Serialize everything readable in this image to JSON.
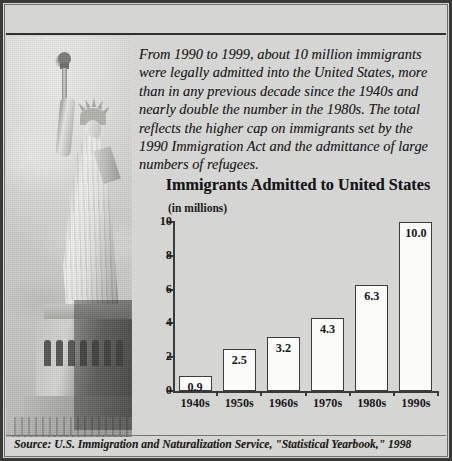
{
  "headline": "Flow of Immigrants Steadily Increased",
  "intro": "From 1990 to 1999, about 10 million immigrants were legally admitted into the United States, more than in any previous decade since the 1940s and nearly double the number in the 1980s. The total reflects the higher cap on immigrants set by the 1990 Immigration Act and the admittance of large numbers of refugees.",
  "photo": {
    "caption": "statue-of-liberty-photograph"
  },
  "source": "Source: U.S. Immigration and Naturalization Service, \"Statistical Yearbook,\" 1998",
  "colors": {
    "paper": "#d7d7d4",
    "ink": "#17171a",
    "axis": "#3a3a38",
    "bar_fill": "#fbfbfa",
    "bar_stroke": "#3c3c3a",
    "frame": "#3a3a38"
  },
  "chart_data": {
    "type": "bar",
    "title": "Immigrants Admitted to United States",
    "subtitle": "(in millions)",
    "xlabel": "",
    "ylabel": "",
    "ylim": [
      0,
      10
    ],
    "yticks": [
      0,
      2,
      4,
      6,
      8,
      10
    ],
    "ytick_labels": [
      "0",
      "2",
      "4",
      "6",
      "8",
      "10"
    ],
    "grid": false,
    "legend": false,
    "categories": [
      "1940s",
      "1950s",
      "1960s",
      "1970s",
      "1980s",
      "1990s"
    ],
    "values": [
      0.9,
      2.5,
      3.2,
      4.3,
      6.3,
      10.0
    ],
    "value_labels": [
      "0.9",
      "2.5",
      "3.2",
      "4.3",
      "6.3",
      "10.0"
    ]
  }
}
